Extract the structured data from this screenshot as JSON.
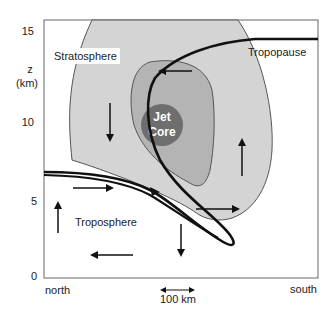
{
  "diagram": {
    "type": "cross-section schematic",
    "y_axis": {
      "label_line1": "z",
      "label_line2": "(km)",
      "ticks": [
        "15",
        "10",
        "5",
        "0"
      ]
    },
    "x_axis": {
      "left_label": "north",
      "right_label": "south",
      "scale_label": "100 km"
    },
    "regions": {
      "stratosphere": "Stratosphere",
      "troposphere": "Troposphere",
      "tropopause": "Tropopause",
      "jet_core_line1": "Jet",
      "jet_core_line2": "Core"
    },
    "colors": {
      "outer_shading": "#d4d4d4",
      "inner_shading": "#b4b4b4",
      "jet_core": "#6e6e6e",
      "lines": "#111111",
      "frame": "#555555"
    }
  }
}
